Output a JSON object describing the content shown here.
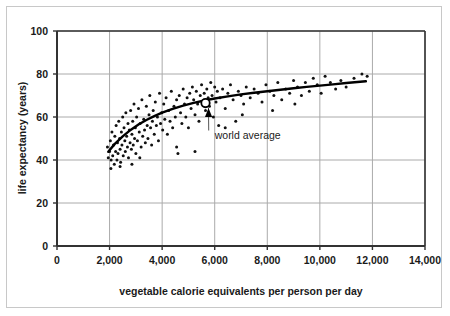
{
  "chart_data": {
    "type": "scatter",
    "title": "",
    "xlabel": "vegetable calorie equivalents per person per day",
    "ylabel": "life expectancy (years)",
    "xlim": [
      0,
      14000
    ],
    "ylim": [
      0,
      100
    ],
    "xticks": [
      0,
      2000,
      4000,
      6000,
      8000,
      10000,
      12000,
      14000
    ],
    "xticklabels": [
      "0",
      "2,000",
      "4,000",
      "6,000",
      "8,000",
      "10,000",
      "12,000",
      "14,000"
    ],
    "yticks": [
      0,
      20,
      40,
      60,
      80,
      100
    ],
    "yticklabels": [
      "0",
      "20",
      "40",
      "60",
      "80",
      "100"
    ],
    "grid": true,
    "legend": "none",
    "point_color": "#111111",
    "trend_color": "#000000",
    "grid_color": "#aaaaaa",
    "axis_color": "#333333",
    "annotations": [
      {
        "text": "world average",
        "text_x": 6000,
        "text_y": 50,
        "point_x": 5650,
        "point_y": 66.5,
        "marker": "open-circle",
        "arrow": true
      }
    ],
    "series": [
      {
        "name": "countries",
        "marker": "dot",
        "points": [
          [
            1920,
            46
          ],
          [
            1950,
            41
          ],
          [
            2000,
            44
          ],
          [
            2030,
            49
          ],
          [
            2060,
            40
          ],
          [
            2090,
            53
          ],
          [
            2120,
            42
          ],
          [
            2150,
            47
          ],
          [
            2180,
            38
          ],
          [
            2200,
            51
          ],
          [
            2230,
            44
          ],
          [
            2250,
            56
          ],
          [
            2280,
            40
          ],
          [
            2300,
            48
          ],
          [
            2320,
            43
          ],
          [
            2350,
            58
          ],
          [
            2380,
            50
          ],
          [
            2400,
            45
          ],
          [
            2420,
            39
          ],
          [
            2450,
            53
          ],
          [
            2470,
            47
          ],
          [
            2500,
            60
          ],
          [
            2520,
            42
          ],
          [
            2550,
            55
          ],
          [
            2580,
            49
          ],
          [
            2600,
            44
          ],
          [
            2620,
            62
          ],
          [
            2650,
            51
          ],
          [
            2680,
            46
          ],
          [
            2700,
            57
          ],
          [
            2720,
            41
          ],
          [
            2750,
            54
          ],
          [
            2780,
            48
          ],
          [
            2800,
            63
          ],
          [
            2830,
            45
          ],
          [
            2850,
            52
          ],
          [
            2880,
            58
          ],
          [
            2900,
            47
          ],
          [
            2930,
            66
          ],
          [
            2950,
            50
          ],
          [
            2980,
            55
          ],
          [
            3000,
            43
          ],
          [
            3030,
            60
          ],
          [
            3060,
            49
          ],
          [
            3100,
            64
          ],
          [
            3130,
            53
          ],
          [
            3160,
            57
          ],
          [
            3200,
            46
          ],
          [
            3230,
            68
          ],
          [
            3260,
            51
          ],
          [
            3300,
            59
          ],
          [
            3330,
            54
          ],
          [
            3360,
            48
          ],
          [
            3400,
            65
          ],
          [
            3430,
            56
          ],
          [
            3460,
            50
          ],
          [
            3500,
            61
          ],
          [
            3530,
            70
          ],
          [
            3560,
            55
          ],
          [
            3600,
            47
          ],
          [
            3630,
            58
          ],
          [
            3660,
            63
          ],
          [
            3700,
            52
          ],
          [
            3740,
            67
          ],
          [
            3780,
            56
          ],
          [
            3820,
            60
          ],
          [
            3860,
            49
          ],
          [
            3900,
            71
          ],
          [
            3940,
            57
          ],
          [
            3980,
            62
          ],
          [
            4020,
            54
          ],
          [
            4060,
            66
          ],
          [
            4100,
            59
          ],
          [
            4150,
            69
          ],
          [
            4200,
            52
          ],
          [
            4250,
            63
          ],
          [
            4300,
            58
          ],
          [
            4350,
            72
          ],
          [
            4400,
            55
          ],
          [
            4450,
            65
          ],
          [
            4500,
            60
          ],
          [
            4550,
            68
          ],
          [
            4600,
            43
          ],
          [
            4650,
            70
          ],
          [
            4700,
            62
          ],
          [
            4750,
            57
          ],
          [
            4800,
            73
          ],
          [
            4850,
            66
          ],
          [
            4900,
            60
          ],
          [
            4950,
            69
          ],
          [
            5000,
            55
          ],
          [
            5050,
            71
          ],
          [
            5100,
            64
          ],
          [
            5150,
            74
          ],
          [
            5200,
            68
          ],
          [
            5250,
            61
          ],
          [
            5300,
            72
          ],
          [
            5350,
            66
          ],
          [
            5400,
            58
          ],
          [
            5450,
            70
          ],
          [
            5500,
            75
          ],
          [
            5550,
            67
          ],
          [
            5600,
            71
          ],
          [
            5650,
            63
          ],
          [
            5700,
            73
          ],
          [
            5750,
            69
          ],
          [
            5800,
            65
          ],
          [
            5850,
            76
          ],
          [
            5900,
            70
          ],
          [
            5950,
            60
          ],
          [
            6000,
            74
          ],
          [
            6050,
            67
          ],
          [
            6100,
            72
          ],
          [
            6150,
            56
          ],
          [
            6200,
            69
          ],
          [
            6300,
            73
          ],
          [
            6400,
            64
          ],
          [
            6500,
            71
          ],
          [
            6600,
            75
          ],
          [
            6700,
            68
          ],
          [
            6800,
            58
          ],
          [
            6900,
            72
          ],
          [
            7000,
            70
          ],
          [
            7100,
            66
          ],
          [
            7200,
            74
          ],
          [
            7350,
            69
          ],
          [
            7500,
            73
          ],
          [
            7650,
            71
          ],
          [
            7800,
            67
          ],
          [
            7950,
            75
          ],
          [
            8100,
            72
          ],
          [
            8250,
            70
          ],
          [
            8400,
            76
          ],
          [
            8550,
            68
          ],
          [
            8700,
            73
          ],
          [
            8850,
            71
          ],
          [
            9000,
            77
          ],
          [
            9150,
            74
          ],
          [
            9300,
            70
          ],
          [
            9450,
            76
          ],
          [
            9600,
            72
          ],
          [
            9750,
            78
          ],
          [
            9900,
            75
          ],
          [
            10050,
            71
          ],
          [
            10200,
            79
          ],
          [
            10400,
            76
          ],
          [
            10600,
            73
          ],
          [
            10800,
            77
          ],
          [
            11000,
            74
          ],
          [
            11300,
            78
          ],
          [
            11600,
            80
          ],
          [
            11800,
            79
          ],
          [
            2050,
            36
          ],
          [
            2400,
            37
          ],
          [
            2850,
            38
          ],
          [
            3150,
            41
          ],
          [
            4550,
            46
          ],
          [
            5250,
            44
          ],
          [
            6400,
            55
          ],
          [
            7050,
            61
          ],
          [
            8200,
            63
          ],
          [
            9050,
            66
          ]
        ]
      }
    ],
    "trend_curve": {
      "name": "fitted trend",
      "x_start": 1950,
      "x_end": 11750,
      "points": [
        [
          1950,
          43.8
        ],
        [
          2200,
          47.5
        ],
        [
          2500,
          51.0
        ],
        [
          2800,
          54.0
        ],
        [
          3100,
          56.5
        ],
        [
          3400,
          58.6
        ],
        [
          3700,
          60.4
        ],
        [
          4000,
          62.0
        ],
        [
          4400,
          63.8
        ],
        [
          4800,
          65.3
        ],
        [
          5200,
          66.6
        ],
        [
          5650,
          67.8
        ],
        [
          6000,
          68.6
        ],
        [
          6500,
          69.6
        ],
        [
          7000,
          70.5
        ],
        [
          7500,
          71.3
        ],
        [
          8000,
          72.0
        ],
        [
          8500,
          72.7
        ],
        [
          9000,
          73.4
        ],
        [
          9500,
          74.0
        ],
        [
          10000,
          74.6
        ],
        [
          10500,
          75.2
        ],
        [
          11000,
          75.8
        ],
        [
          11750,
          76.6
        ]
      ]
    }
  },
  "figure": {
    "border": true
  }
}
